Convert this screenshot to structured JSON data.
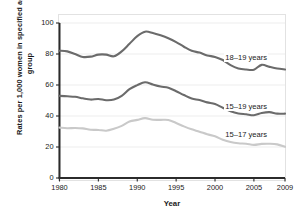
{
  "chart_data": {
    "type": "line",
    "title": "",
    "xlabel": "Year",
    "ylabel": "Rates per 1,000 women in specified age group",
    "xlim": [
      1980,
      2009
    ],
    "ylim": [
      0,
      100
    ],
    "yticks": [
      0,
      20,
      40,
      60,
      80,
      100
    ],
    "xticks": [
      1980,
      1985,
      1990,
      1995,
      2000,
      2005,
      2009
    ],
    "grid": "horizontal",
    "legend_position": "inline-right",
    "x": [
      1980,
      1981,
      1982,
      1983,
      1984,
      1985,
      1986,
      1987,
      1988,
      1989,
      1990,
      1991,
      1992,
      1993,
      1994,
      1995,
      1996,
      1997,
      1998,
      1999,
      2000,
      2001,
      2002,
      2003,
      2004,
      2005,
      2006,
      2007,
      2008,
      2009
    ],
    "series": [
      {
        "name": "18–19 years",
        "color": "#6b6b6b",
        "label_x_year": 2001.2,
        "label_y_value": 77.5,
        "values": [
          82.1,
          81.7,
          80.0,
          78.1,
          78.3,
          79.6,
          79.6,
          78.5,
          81.7,
          86.6,
          91.5,
          94.4,
          93.6,
          92.1,
          90.2,
          87.7,
          84.7,
          82.1,
          80.9,
          79.1,
          78.1,
          76.1,
          72.8,
          70.7,
          70.0,
          69.9,
          73.0,
          71.7,
          70.6,
          70.0
        ]
      },
      {
        "name": "15–19 years",
        "color": "#6b6b6b",
        "label_x_year": 2001.2,
        "label_y_value": 46.0,
        "values": [
          53.0,
          52.7,
          52.4,
          51.4,
          50.6,
          51.0,
          50.2,
          50.6,
          53.0,
          57.3,
          59.9,
          61.8,
          60.3,
          59.0,
          58.2,
          56.0,
          53.5,
          51.3,
          50.3,
          48.8,
          47.7,
          45.3,
          43.0,
          41.6,
          41.1,
          40.5,
          41.9,
          42.5,
          41.5,
          41.5
        ]
      },
      {
        "name": "15–17 years",
        "color": "#c9c9c9",
        "label_x_year": 2001.2,
        "label_y_value": 28.0,
        "values": [
          32.5,
          32.1,
          32.3,
          32.0,
          31.1,
          31.0,
          30.5,
          31.7,
          33.6,
          36.4,
          37.5,
          38.6,
          37.6,
          37.5,
          37.4,
          35.5,
          33.3,
          31.4,
          29.9,
          28.2,
          26.9,
          24.7,
          23.2,
          22.4,
          22.1,
          21.4,
          22.0,
          22.1,
          21.7,
          20.1
        ]
      }
    ]
  }
}
